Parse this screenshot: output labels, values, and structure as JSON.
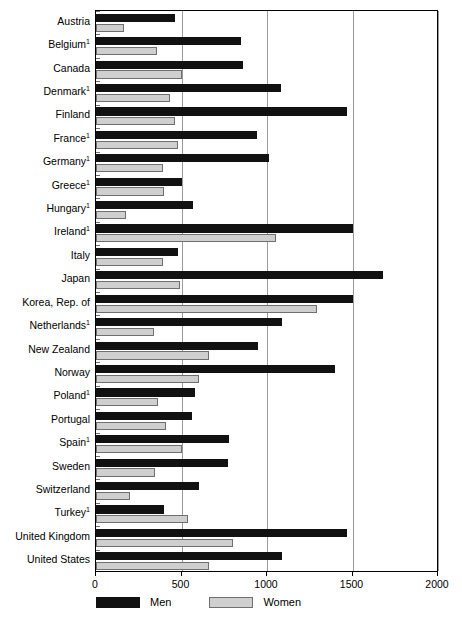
{
  "chart_data": {
    "type": "bar",
    "orientation": "horizontal",
    "title": "",
    "xlabel": "",
    "ylabel": "",
    "xlim": [
      0,
      2000
    ],
    "xticks": [
      0,
      500,
      1000,
      1500,
      2000
    ],
    "xtick_labels": [
      "0",
      "500",
      "1000",
      "1500",
      "2000"
    ],
    "grid": true,
    "grid_axis": "x",
    "legend_position": "bottom-left",
    "categories": [
      "Austria",
      "Belgium",
      "Canada",
      "Denmark",
      "Finland",
      "France",
      "Germany",
      "Greece",
      "Hungary",
      "Ireland",
      "Italy",
      "Japan",
      "Korea, Rep. of",
      "Netherlands",
      "New Zealand",
      "Norway",
      "Poland",
      "Portugal",
      "Spain",
      "Sweden",
      "Switzerland",
      "Turkey",
      "United Kingdom",
      "United States"
    ],
    "category_footnotes": [
      "",
      "1",
      "",
      "1",
      "",
      "1",
      "1",
      "1",
      "1",
      "1",
      "",
      "",
      "",
      "1",
      "",
      "",
      "1",
      "",
      "1",
      "",
      "",
      "1",
      "",
      ""
    ],
    "series": [
      {
        "name": "Men",
        "color": "#111111",
        "values": [
          462,
          850,
          860,
          1080,
          1470,
          940,
          1010,
          500,
          570,
          1500,
          480,
          1680,
          1500,
          1090,
          950,
          1400,
          580,
          560,
          780,
          770,
          600,
          400,
          1470,
          1090
        ]
      },
      {
        "name": "Women",
        "color": "#cfcfcf",
        "values": [
          164,
          355,
          500,
          430,
          460,
          480,
          390,
          400,
          175,
          1050,
          390,
          490,
          1290,
          340,
          660,
          600,
          360,
          410,
          500,
          345,
          200,
          540,
          800,
          660
        ]
      }
    ]
  },
  "legend": {
    "items": [
      {
        "label": "Men",
        "swatch": "men-swatch"
      },
      {
        "label": "Women",
        "swatch": "women-swatch"
      }
    ]
  }
}
